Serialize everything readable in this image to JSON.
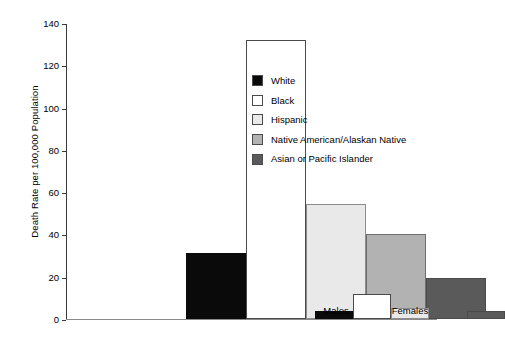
{
  "chart_data": {
    "type": "bar",
    "title": "",
    "xlabel": "",
    "ylabel": "Death Rate per 100,000 Population",
    "ylim": [
      0,
      140
    ],
    "yticks": [
      0,
      20,
      40,
      60,
      80,
      100,
      120,
      140
    ],
    "grid": false,
    "legend_position": "upper right inside plot",
    "categories": [
      "Males",
      "Females"
    ],
    "series": [
      {
        "name": "White",
        "values": [
          31,
          4
        ],
        "color": "#0a0a0a"
      },
      {
        "name": "Black",
        "values": [
          132,
          12
        ],
        "color": "#ffffff"
      },
      {
        "name": "Hispanic",
        "values": [
          54.5,
          5
        ],
        "color": "#e9e9e9"
      },
      {
        "name": "Native American/Alaskan Native",
        "values": [
          40,
          0
        ],
        "color": "#b2b2b2"
      },
      {
        "name": "Asian or Pacific Islander",
        "values": [
          19.5,
          4
        ],
        "color": "#5a5a5a"
      }
    ]
  },
  "axis": {
    "y_tick_labels": [
      "0",
      "20",
      "40",
      "60",
      "80",
      "100",
      "120",
      "140"
    ]
  }
}
